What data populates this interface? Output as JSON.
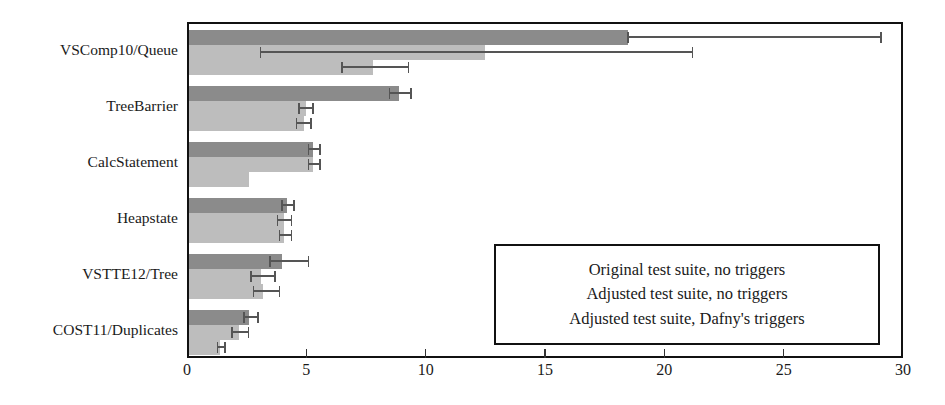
{
  "chart_data": {
    "type": "bar",
    "orientation": "horizontal",
    "title": "",
    "xlabel": "",
    "ylabel": "",
    "xlim": [
      0,
      30
    ],
    "xticks": [
      0,
      5,
      10,
      15,
      20,
      25,
      30
    ],
    "xtick_labels": [
      "0",
      "5",
      "10",
      "15",
      "20",
      "25",
      "30"
    ],
    "grid": false,
    "legend_position": "inside-lower-right",
    "categories": [
      "VSComp10/Queue",
      "TreeBarrier",
      "CalcStatement",
      "Heapstate",
      "VSTTE12/Tree",
      "COST11/Duplicates"
    ],
    "series": [
      {
        "name": "Original test suite, no triggers",
        "color": "#8b8b8b",
        "values": [
          18.4,
          8.8,
          5.2,
          4.1,
          3.9,
          2.5
        ],
        "err_low": [
          18.4,
          8.4,
          5.0,
          3.9,
          3.4,
          2.3
        ],
        "err_high": [
          29.0,
          9.3,
          5.5,
          4.4,
          5.0,
          2.9
        ]
      },
      {
        "name": "Adjusted test suite, no triggers",
        "color": "#bdbdbd",
        "values": [
          12.4,
          4.9,
          5.2,
          4.0,
          3.0,
          2.1
        ],
        "err_low": [
          3.0,
          4.6,
          5.0,
          3.7,
          2.6,
          1.8
        ],
        "err_high": [
          21.1,
          5.2,
          5.5,
          4.3,
          3.6,
          2.5
        ]
      },
      {
        "name": "Adjusted test suite, Dafny's triggers",
        "color": "#bdbdbd",
        "values": [
          7.7,
          4.8,
          2.5,
          4.0,
          3.1,
          1.3
        ],
        "err_low": [
          6.4,
          4.5,
          2.5,
          3.8,
          2.7,
          1.2
        ],
        "err_high": [
          9.2,
          5.1,
          2.5,
          4.3,
          3.8,
          1.5
        ]
      }
    ]
  },
  "legend": {
    "entries": [
      "Original test suite, no triggers",
      "Adjusted test suite, no triggers",
      "Adjusted test suite, Dafny's triggers"
    ]
  }
}
